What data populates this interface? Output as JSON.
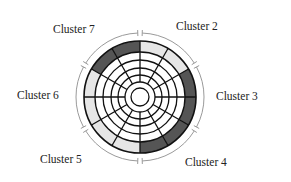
{
  "diagram": {
    "type": "cluster-wheel",
    "center": [
      140,
      97
    ],
    "outer_radius": 56,
    "ring_radii": [
      56,
      45,
      37,
      29,
      22,
      15,
      9
    ],
    "spoke_count": 12,
    "spoke_inner_radius": 15,
    "bracket_radius": 64,
    "colors": {
      "dark": "#555555",
      "light": "#e6e6e6",
      "line": "#111111",
      "bracket": "#9a9a9a",
      "text": "#222222"
    },
    "outer_segments": [
      {
        "start": 0,
        "end": 30,
        "shade": "light"
      },
      {
        "start": 30,
        "end": 60,
        "shade": "light"
      },
      {
        "start": 60,
        "end": 90,
        "shade": "dark"
      },
      {
        "start": 90,
        "end": 120,
        "shade": "dark"
      },
      {
        "start": 120,
        "end": 150,
        "shade": "dark"
      },
      {
        "start": 150,
        "end": 180,
        "shade": "dark"
      },
      {
        "start": 180,
        "end": 210,
        "shade": "light"
      },
      {
        "start": 210,
        "end": 240,
        "shade": "light"
      },
      {
        "start": 240,
        "end": 270,
        "shade": "light"
      },
      {
        "start": 270,
        "end": 300,
        "shade": "light"
      },
      {
        "start": 300,
        "end": 330,
        "shade": "dark"
      },
      {
        "start": 330,
        "end": 360,
        "shade": "dark"
      }
    ],
    "brackets": [
      {
        "name": "cluster-2",
        "start": 2,
        "end": 58
      },
      {
        "name": "cluster-3",
        "start": 62,
        "end": 118
      },
      {
        "name": "cluster-4",
        "start": 122,
        "end": 178
      },
      {
        "name": "cluster-5",
        "start": 182,
        "end": 238
      },
      {
        "name": "cluster-6",
        "start": 242,
        "end": 298
      },
      {
        "name": "cluster-7",
        "start": 302,
        "end": 358
      }
    ],
    "labels": [
      {
        "key": "cluster7",
        "text": "Cluster 7",
        "x": 53,
        "y": 24
      },
      {
        "key": "cluster2",
        "text": "Cluster 2",
        "x": 176,
        "y": 21
      },
      {
        "key": "cluster6",
        "text": "Cluster 6",
        "x": 17,
        "y": 90
      },
      {
        "key": "cluster3",
        "text": "Cluster 3",
        "x": 216,
        "y": 91
      },
      {
        "key": "cluster5",
        "text": "Cluster 5",
        "x": 40,
        "y": 154
      },
      {
        "key": "cluster4",
        "text": "Cluster 4",
        "x": 185,
        "y": 157
      }
    ]
  },
  "labels": {
    "cluster2": "Cluster 2",
    "cluster3": "Cluster 3",
    "cluster4": "Cluster 4",
    "cluster5": "Cluster 5",
    "cluster6": "Cluster 6",
    "cluster7": "Cluster 7"
  }
}
